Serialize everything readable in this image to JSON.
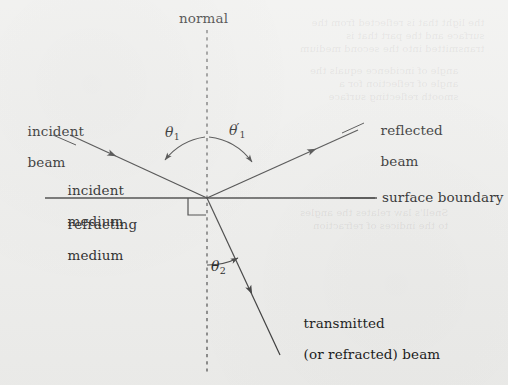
{
  "figure": {
    "type": "optics-ray-diagram",
    "background_color": "#eeeeec",
    "ink_color": "#3a3a3a",
    "text_color": "#161616"
  },
  "labels": {
    "normal": "normal",
    "incident_beam_line1": "incident",
    "incident_beam_line2": "beam",
    "reflected_beam_line1": "reflected",
    "reflected_beam_line2": "beam",
    "incident_medium_line1": "incident",
    "incident_medium_line2": "medium",
    "refracting_medium_line1": "refracting",
    "refracting_medium_line2": "medium",
    "surface_boundary": "surface boundary",
    "transmitted_beam_line1": "transmitted",
    "transmitted_beam_line2": "(or refracted) beam"
  },
  "angles": {
    "theta1": {
      "symbol": "θ",
      "subscript": "1",
      "prime": ""
    },
    "theta1_prime": {
      "symbol": "θ",
      "subscript": "1",
      "prime": "′"
    },
    "theta2": {
      "symbol": "θ",
      "subscript": "2",
      "prime": ""
    }
  },
  "geometry": {
    "origin_x": 207,
    "origin_y": 198,
    "normal_x": 207,
    "normal_top_y": 30,
    "normal_bottom_y": 375,
    "boundary_y": 198,
    "boundary_left_x": 45,
    "boundary_right_x": 375,
    "incident_start": [
      70,
      135
    ],
    "reflected_end": [
      358,
      130
    ],
    "transmitted_end": [
      280,
      355
    ]
  },
  "ghost_text": {
    "block1": "the light that is reflected from the\nsurface and the part that is\ntransmitted into the second medium",
    "block2": "angle of incidence equals the\nangle of reflection for a\nsmooth reflecting surface",
    "block3": "Snell's law relates the angles\nto the indices of refraction"
  }
}
